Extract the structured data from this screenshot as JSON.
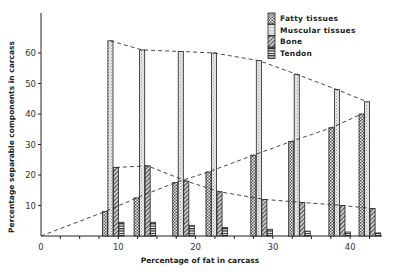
{
  "chart_data": {
    "type": "bar",
    "title": "",
    "xlabel": "Percentage of fat in carcass",
    "ylabel": "Percentage separable components in carcass",
    "xlim": [
      0,
      44
    ],
    "ylim": [
      0,
      68
    ],
    "x_ticks": [
      0,
      10,
      20,
      30,
      40
    ],
    "x_tick_labels": [
      "0",
      "10",
      "20",
      "30",
      "40"
    ],
    "y_ticks": [
      10,
      20,
      30,
      40,
      50,
      60
    ],
    "y_tick_labels": [
      "10",
      "20",
      "30",
      "40",
      "50",
      "60"
    ],
    "grid": false,
    "legend_position": "top-right",
    "x": [
      8.2,
      12.3,
      17.3,
      21.6,
      27.4,
      32.3,
      37.5,
      41.4
    ],
    "series": [
      {
        "name": "Fatty tissues",
        "pattern": "checkered",
        "values": [
          8,
          12.5,
          17.5,
          21,
          26.5,
          31,
          35.5,
          40
        ],
        "trend": "dashed"
      },
      {
        "name": "Muscular tissues",
        "pattern": "stipple",
        "values": [
          64,
          61,
          60.5,
          60,
          57.5,
          53,
          48,
          44
        ],
        "trend": "dashed"
      },
      {
        "name": "Bone",
        "pattern": "diagonal",
        "values": [
          22.5,
          23,
          18,
          14.5,
          12,
          11,
          10,
          9
        ],
        "trend": "dashed"
      },
      {
        "name": "Tendon",
        "pattern": "horizontal",
        "values": [
          4.5,
          4.5,
          3.5,
          2.8,
          2.2,
          1.6,
          1.3,
          1
        ],
        "trend": "none"
      }
    ],
    "annotations": [
      "dashed trend lines connect bar tops of fatty, muscular and bone series; fatty trend starts at origin"
    ]
  }
}
